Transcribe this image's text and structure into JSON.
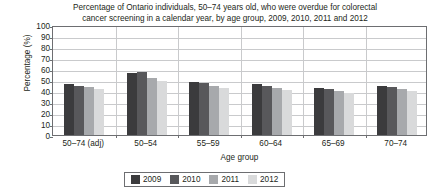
{
  "chart_data": {
    "type": "bar",
    "title": "Percentage of Ontario individuals, 50–74 years old, who were overdue for colorectal cancer screening in a calendar year, by age group, 2009, 2010, 2011 and 2012",
    "title_lines": [
      "Percentage of Ontario individuals, 50–74 years old, who were overdue for colorectal",
      "cancer screening in a calendar year, by age group, 2009, 2010, 2011 and 2012"
    ],
    "xlabel": "Age group",
    "ylabel": "Percentage (%)",
    "ylim": [
      0,
      100
    ],
    "ytick_labels": [
      "100",
      "90",
      "80",
      "70",
      "60",
      "50",
      "40",
      "30",
      "20",
      "10",
      "0"
    ],
    "ytick_values": [
      100,
      90,
      80,
      70,
      60,
      50,
      40,
      30,
      20,
      10,
      0
    ],
    "grid": true,
    "legend_position": "bottom",
    "categories": [
      "50–74 (adj)",
      "50–54",
      "55–59",
      "60–64",
      "65–69",
      "70–74"
    ],
    "series": [
      {
        "name": "2009",
        "color": "#3b3b3d",
        "values": [
          46,
          56,
          48,
          46,
          43,
          45
        ]
      },
      {
        "name": "2010",
        "color": "#58585b",
        "values": [
          45,
          57,
          47,
          45,
          42,
          44
        ]
      },
      {
        "name": "2011",
        "color": "#a7a9ac",
        "values": [
          44,
          52,
          45,
          43,
          40,
          42
        ]
      },
      {
        "name": "2012",
        "color": "#d9dadb",
        "values": [
          42,
          49,
          43,
          41,
          38,
          40
        ]
      }
    ]
  }
}
